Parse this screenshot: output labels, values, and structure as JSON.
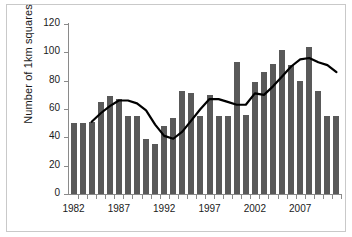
{
  "chart_data": {
    "type": "bar",
    "title": "",
    "subtitle": "",
    "xlabel": "",
    "ylabel": "Number of 1km squares",
    "ylim": [
      0,
      120
    ],
    "yticks": [
      0,
      20,
      40,
      60,
      80,
      100,
      120
    ],
    "xticks_labeled": [
      "1982",
      "1987",
      "1992",
      "1997",
      "2002",
      "2007"
    ],
    "grid": false,
    "legend": "none",
    "categories": [
      "1982",
      "1983",
      "1984",
      "1985",
      "1986",
      "1987",
      "1988",
      "1989",
      "1990",
      "1991",
      "1992",
      "1993",
      "1994",
      "1995",
      "1996",
      "1997",
      "1998",
      "1999",
      "2000",
      "2001",
      "2002",
      "2003",
      "2004",
      "2005",
      "2006",
      "2007",
      "2008",
      "2009",
      "2010",
      "2011"
    ],
    "series": [
      {
        "name": "Number of 1km squares",
        "type": "bar",
        "color": "#595959",
        "values": [
          50,
          50,
          51,
          65,
          69,
          67,
          55,
          55,
          39,
          35,
          48,
          54,
          73,
          71,
          55,
          70,
          55,
          55,
          93,
          56,
          79,
          86,
          92,
          102,
          91,
          80,
          104,
          73,
          55,
          55
        ]
      },
      {
        "name": "5-year moving average",
        "type": "line",
        "color": "#000000",
        "values": [
          null,
          null,
          51,
          57,
          62,
          66,
          66,
          64,
          59,
          49,
          41,
          39,
          44,
          52,
          60,
          67,
          67,
          65,
          63,
          63,
          71,
          70,
          76,
          83,
          90,
          95,
          96,
          93,
          91,
          86
        ]
      }
    ]
  }
}
